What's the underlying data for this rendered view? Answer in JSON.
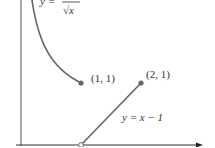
{
  "chart_data": {
    "type": "line",
    "title": "",
    "xlabel": "",
    "ylabel": "",
    "xlim": [
      0,
      3.2
    ],
    "ylim": [
      0,
      2.35
    ],
    "grid": false,
    "series": [
      {
        "name": "y = 1/sqrt(x)",
        "function": "1/sqrt(x)",
        "domain": [
          0.18,
          1
        ],
        "end_point": {
          "x": 1,
          "y": 1,
          "filled": true
        }
      },
      {
        "name": "y = x - 1",
        "function": "x - 1",
        "domain": [
          1,
          2
        ],
        "start_point": {
          "x": 1,
          "y": 0,
          "filled": false
        },
        "end_point": {
          "x": 2,
          "y": 1,
          "filled": true
        }
      }
    ],
    "annotations": [
      {
        "text": "(1, 1)",
        "x": 1,
        "y": 1
      },
      {
        "text": "(2, 1)",
        "x": 2,
        "y": 1
      }
    ],
    "labels": {
      "curve1_lhs": "y = ",
      "curve1_num": "1",
      "curve1_den": "√x",
      "curve2": "y = x − 1",
      "point1": "(1, 1)",
      "point2": "(2, 1)"
    },
    "colors": {
      "curve": "#555555",
      "axis": "#333333",
      "text": "#333333"
    }
  }
}
